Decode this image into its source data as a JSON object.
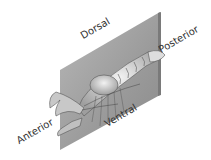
{
  "diagram": {
    "labels": {
      "dorsal": "Dorsal",
      "posterior": "Posterior",
      "anterior": "Anterior",
      "ventral": "Ventral"
    }
  }
}
